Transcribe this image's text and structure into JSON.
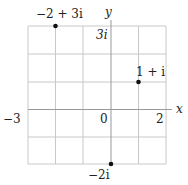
{
  "diagram": {
    "type": "complex-plane",
    "axes": {
      "x_label": "x",
      "y_label": "y",
      "origin_label": "0",
      "x_min_label": "−3",
      "x_max_label": "2",
      "y_max_label": "3i",
      "y_min_label": "−2i"
    },
    "grid": {
      "x_range": [
        -3,
        2
      ],
      "y_range": [
        -2,
        3
      ],
      "step": 1
    },
    "points": [
      {
        "label": "−2 + 3i",
        "re": -2,
        "im": 3
      },
      {
        "label": "1 + i",
        "re": 1,
        "im": 1
      },
      {
        "label": "−2i",
        "re": 0,
        "im": -2
      }
    ],
    "colors": {
      "grid": "#c8c8c8",
      "axis": "#999999",
      "point": "#111111",
      "text": "#222222"
    }
  }
}
